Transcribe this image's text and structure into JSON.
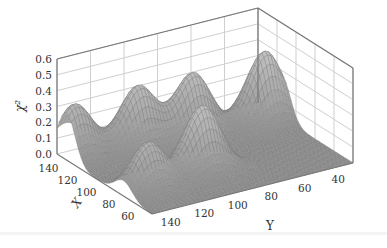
{
  "chart_data": {
    "type": "surface3d",
    "title": "",
    "xlabel": "X",
    "ylabel": "Y",
    "zlabel": "χ²",
    "x_ticks": [
      "140",
      "120",
      "100",
      "80",
      "60"
    ],
    "y_ticks": [
      "140",
      "120",
      "100",
      "80",
      "60",
      "40"
    ],
    "z_ticks": [
      "0.0",
      "0.1",
      "0.2",
      "0.3",
      "0.4",
      "0.5",
      "0.6"
    ],
    "xlim": [
      50,
      150
    ],
    "ylim": [
      30,
      150
    ],
    "zlim": [
      0.0,
      0.6
    ],
    "grid": true,
    "peaks": [
      {
        "x": 140,
        "y": 145,
        "z": 0.34
      },
      {
        "x": 135,
        "y": 110,
        "z": 0.38
      },
      {
        "x": 130,
        "y": 80,
        "z": 0.4
      },
      {
        "x": 125,
        "y": 40,
        "z": 0.45
      },
      {
        "x": 80,
        "y": 135,
        "z": 0.3
      },
      {
        "x": 85,
        "y": 100,
        "z": 0.42
      }
    ],
    "colors": {
      "surface": "#8a8a8a",
      "mesh": "#b5b5b5",
      "grid": "#cfcfcf",
      "box": "#777777"
    }
  }
}
